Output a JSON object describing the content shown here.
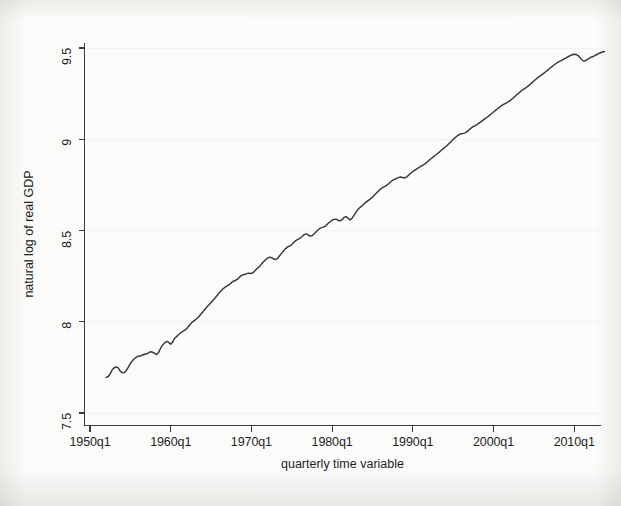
{
  "figure": {
    "background_color": "#fbfbfa",
    "line_color": "#38383a",
    "axis_color": "#3b3b3b",
    "grid_color": "#f1f1ef"
  },
  "chart_data": {
    "type": "line",
    "title": "",
    "xlabel": "quarterly time variable",
    "ylabel": "natural log of real GDP",
    "grid": "horizontal-faint",
    "legend": "none",
    "xlim": [
      "1950q1",
      "2011q2"
    ],
    "ylim": [
      7.5,
      9.5
    ],
    "xtick_labels": [
      "1950q1",
      "1960q1",
      "1970q1",
      "1980q1",
      "1990q1",
      "2000q1",
      "2010q1"
    ],
    "ytick_labels": [
      "7.5",
      "8",
      "8.5",
      "9",
      "9.5"
    ],
    "ytick_values": [
      7.5,
      8,
      8.5,
      9,
      9.5
    ],
    "series": [
      {
        "name": "natural log of real GDP",
        "x_start": "1952q1",
        "x_step_years": 0.25,
        "values": [
          7.695,
          7.7,
          7.714,
          7.737,
          7.748,
          7.752,
          7.747,
          7.729,
          7.721,
          7.722,
          7.733,
          7.751,
          7.771,
          7.786,
          7.797,
          7.806,
          7.812,
          7.812,
          7.818,
          7.822,
          7.823,
          7.829,
          7.836,
          7.833,
          7.828,
          7.82,
          7.832,
          7.855,
          7.873,
          7.884,
          7.893,
          7.887,
          7.877,
          7.89,
          7.91,
          7.92,
          7.93,
          7.941,
          7.947,
          7.954,
          7.962,
          7.977,
          7.99,
          8.001,
          8.009,
          8.018,
          8.029,
          8.042,
          8.055,
          8.069,
          8.082,
          8.093,
          8.106,
          8.118,
          8.13,
          8.144,
          8.158,
          8.17,
          8.181,
          8.19,
          8.196,
          8.203,
          8.213,
          8.222,
          8.226,
          8.232,
          8.243,
          8.253,
          8.258,
          8.26,
          8.265,
          8.266,
          8.264,
          8.27,
          8.283,
          8.293,
          8.302,
          8.316,
          8.329,
          8.339,
          8.349,
          8.354,
          8.351,
          8.344,
          8.341,
          8.348,
          8.362,
          8.376,
          8.389,
          8.401,
          8.41,
          8.415,
          8.423,
          8.434,
          8.445,
          8.451,
          8.457,
          8.466,
          8.476,
          8.482,
          8.477,
          8.469,
          8.471,
          8.481,
          8.492,
          8.503,
          8.512,
          8.517,
          8.52,
          8.527,
          8.538,
          8.548,
          8.556,
          8.561,
          8.562,
          8.556,
          8.553,
          8.56,
          8.573,
          8.576,
          8.566,
          8.558,
          8.569,
          8.586,
          8.602,
          8.618,
          8.628,
          8.637,
          8.648,
          8.657,
          8.665,
          8.673,
          8.682,
          8.694,
          8.705,
          8.716,
          8.727,
          8.735,
          8.741,
          8.747,
          8.756,
          8.766,
          8.775,
          8.781,
          8.786,
          8.791,
          8.793,
          8.79,
          8.788,
          8.794,
          8.804,
          8.814,
          8.823,
          8.831,
          8.838,
          8.845,
          8.852,
          8.858,
          8.865,
          8.874,
          8.884,
          8.893,
          8.902,
          8.911,
          8.919,
          8.928,
          8.938,
          8.947,
          8.956,
          8.966,
          8.977,
          8.988,
          8.999,
          9.009,
          9.018,
          9.025,
          9.03,
          9.032,
          9.035,
          9.043,
          9.053,
          9.062,
          9.069,
          9.075,
          9.082,
          9.09,
          9.098,
          9.106,
          9.114,
          9.122,
          9.131,
          9.14,
          9.149,
          9.158,
          9.167,
          9.176,
          9.184,
          9.191,
          9.197,
          9.203,
          9.21,
          9.219,
          9.228,
          9.238,
          9.248,
          9.258,
          9.267,
          9.275,
          9.282,
          9.29,
          9.299,
          9.309,
          9.319,
          9.329,
          9.338,
          9.346,
          9.354,
          9.362,
          9.371,
          9.38,
          9.389,
          9.398,
          9.407,
          9.415,
          9.422,
          9.428,
          9.434,
          9.44,
          9.446,
          9.452,
          9.458,
          9.463,
          9.466,
          9.464,
          9.458,
          9.446,
          9.432,
          9.428,
          9.433,
          9.441,
          9.448,
          9.452,
          9.457,
          9.463,
          9.469,
          9.474,
          9.478,
          9.481
        ]
      }
    ]
  }
}
